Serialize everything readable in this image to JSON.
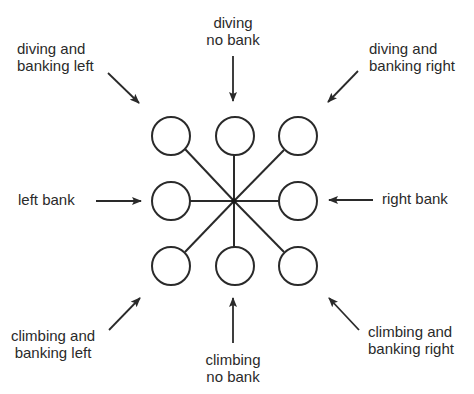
{
  "diagram": {
    "type": "attitude-indicator-directions",
    "hub": {
      "x": 234,
      "y": 201
    },
    "circle_radius": 19,
    "circles": [
      {
        "id": "top-left",
        "x": 171,
        "y": 136
      },
      {
        "id": "top-center",
        "x": 235,
        "y": 136
      },
      {
        "id": "top-right",
        "x": 298,
        "y": 136
      },
      {
        "id": "middle-left",
        "x": 171,
        "y": 201
      },
      {
        "id": "middle-right",
        "x": 298,
        "y": 201
      },
      {
        "id": "bottom-left",
        "x": 171,
        "y": 266
      },
      {
        "id": "bottom-center",
        "x": 235,
        "y": 266
      },
      {
        "id": "bottom-right",
        "x": 298,
        "y": 266
      }
    ],
    "labels": {
      "diving_banking_left": {
        "line1": "diving and",
        "line2": "banking left"
      },
      "diving_no_bank": {
        "line1": "diving",
        "line2": "no bank"
      },
      "diving_banking_right": {
        "line1": "diving and",
        "line2": "banking right"
      },
      "left_bank": {
        "line1": "left bank"
      },
      "right_bank": {
        "line1": "right bank"
      },
      "climbing_banking_left": {
        "line1": "climbing and",
        "line2": "banking left"
      },
      "climbing_no_bank": {
        "line1": "climbing",
        "line2": "no bank"
      },
      "climbing_banking_right": {
        "line1": "climbing and",
        "line2": "banking right"
      }
    },
    "colors": {
      "stroke": "#2a2a2a",
      "text": "#2a2a2a",
      "background": "#ffffff"
    }
  }
}
